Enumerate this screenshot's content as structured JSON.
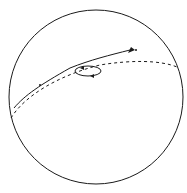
{
  "diagram": {
    "colors": {
      "stroke": "#1a1a1a",
      "background": "#ffffff"
    },
    "sphere": {
      "cx": 96,
      "cy": 97,
      "r": 87
    },
    "great_circle": {
      "style": "dashed"
    },
    "path": {
      "style": "solid",
      "arrow": "forward"
    },
    "loop": {
      "style": "solid",
      "arrow": "circulation"
    }
  }
}
